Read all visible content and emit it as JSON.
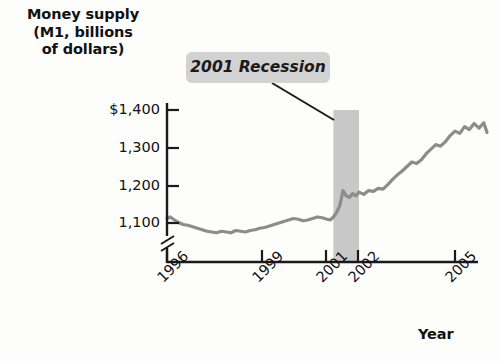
{
  "chart_data": {
    "type": "line",
    "title": "",
    "ylabel_lines": [
      "Money supply",
      "(M1, billions",
      "of dollars)"
    ],
    "ylabel": "Money supply (M1, billions of dollars)",
    "xlabel": "Year",
    "ytick_labels": [
      "$1,400",
      "1,300",
      "1,200",
      "1,100"
    ],
    "ytick_values": [
      1400,
      1300,
      1200,
      1100
    ],
    "ylim": [
      1050,
      1430
    ],
    "y_axis_break": true,
    "xtick_labels": [
      "1996",
      "1999",
      "2001",
      "2002",
      "2005"
    ],
    "xtick_values": [
      1996,
      1999,
      2001,
      2002,
      2005
    ],
    "xlim": [
      1996,
      2006.1
    ],
    "grid": false,
    "legend": null,
    "line_color": "#8c8c8c",
    "annotations": [
      {
        "text": "2001 Recession",
        "type": "callout",
        "points_to": "recession-band"
      }
    ],
    "shaded_regions": [
      {
        "name": "2001 Recession",
        "x_start": 2001.2,
        "x_end": 2002.0,
        "color": "#c8c8c8"
      }
    ],
    "series": [
      {
        "name": "M1 money supply",
        "x": [
          1996.0,
          1996.1,
          1996.2,
          1996.35,
          1996.5,
          1996.65,
          1996.8,
          1996.95,
          1997.1,
          1997.25,
          1997.4,
          1997.55,
          1997.7,
          1997.85,
          1998.0,
          1998.15,
          1998.3,
          1998.45,
          1998.6,
          1998.75,
          1998.9,
          1999.05,
          1999.2,
          1999.35,
          1999.5,
          1999.65,
          1999.8,
          1999.95,
          2000.1,
          2000.25,
          2000.4,
          2000.55,
          2000.7,
          2000.85,
          2001.0,
          2001.1,
          2001.2,
          2001.3,
          2001.4,
          2001.5,
          2001.6,
          2001.7,
          2001.8,
          2001.9,
          2002.0,
          2002.15,
          2002.3,
          2002.45,
          2002.6,
          2002.75,
          2002.9,
          2003.05,
          2003.2,
          2003.35,
          2003.5,
          2003.65,
          2003.8,
          2003.95,
          2004.1,
          2004.25,
          2004.4,
          2004.55,
          2004.7,
          2004.85,
          2005.0,
          2005.15,
          2005.3,
          2005.45,
          2005.6,
          2005.75,
          2005.9,
          2006.0
        ],
        "y": [
          1112,
          1116,
          1110,
          1102,
          1096,
          1094,
          1090,
          1086,
          1082,
          1078,
          1076,
          1074,
          1078,
          1076,
          1074,
          1080,
          1078,
          1076,
          1080,
          1082,
          1086,
          1088,
          1092,
          1096,
          1100,
          1104,
          1108,
          1112,
          1110,
          1106,
          1108,
          1112,
          1116,
          1114,
          1110,
          1108,
          1116,
          1128,
          1146,
          1186,
          1172,
          1168,
          1178,
          1172,
          1182,
          1176,
          1186,
          1184,
          1192,
          1190,
          1202,
          1216,
          1228,
          1238,
          1250,
          1262,
          1258,
          1268,
          1284,
          1296,
          1308,
          1304,
          1316,
          1332,
          1344,
          1338,
          1356,
          1348,
          1364,
          1352,
          1366,
          1340
        ]
      }
    ]
  },
  "chart": {
    "annotation_text": "2001 Recession"
  }
}
